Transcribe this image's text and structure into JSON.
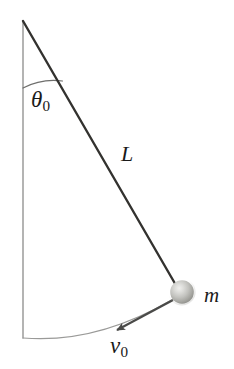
{
  "figure": {
    "type": "physics-diagram",
    "background_color": "#ffffff",
    "width": 234,
    "height": 369
  },
  "labels": {
    "angle": {
      "symbol": "θ",
      "subscript": "0",
      "meaning": "initial angular displacement from vertical"
    },
    "length": {
      "symbol": "L",
      "subscript": "",
      "meaning": "pendulum string length"
    },
    "mass": {
      "symbol": "m",
      "subscript": "",
      "meaning": "bob mass"
    },
    "velocity": {
      "symbol": "v",
      "subscript": "0",
      "meaning": "initial tangential speed of bob"
    }
  },
  "geometry": {
    "pivot": {
      "x": 23,
      "y": 21
    },
    "bob": {
      "x": 182,
      "y": 292,
      "radius": 12
    },
    "vertical_line": {
      "x1": 23,
      "y1": 21,
      "x2": 23,
      "y2": 338
    },
    "string": {
      "x1": 23,
      "y1": 21,
      "x2": 176,
      "y2": 286
    },
    "angle_arc": {
      "start_x": 23,
      "start_y": 88,
      "end_x": 63,
      "end_y": 81,
      "radius": 67
    },
    "swing_arc": {
      "start_x": 23,
      "start_y": 338,
      "end_x": 172,
      "end_y": 300,
      "radius": 318
    },
    "velocity_arrow": {
      "tail_x": 172,
      "tail_y": 301,
      "head_x": 113,
      "head_y": 332
    },
    "angle_degrees": 30
  },
  "colors": {
    "string": "#33322f",
    "vertical_line": "#8c8c8a",
    "swing_arc": "#9a9a98",
    "angle_arc": "#6e6e6c",
    "arrow": "#4a4a48",
    "bob_light": "#e2e2e0",
    "bob_mid": "#b2b2ae",
    "bob_dark": "#8f8f8b",
    "text": "#1a1a1a"
  }
}
